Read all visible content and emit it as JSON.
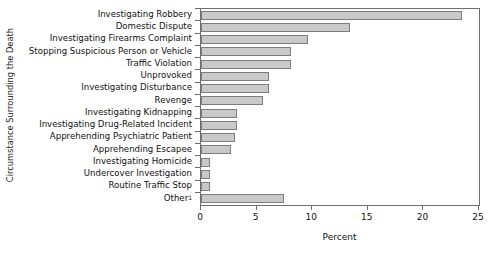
{
  "chart_data": {
    "type": "bar",
    "orientation": "horizontal",
    "title": "",
    "xlabel": "Percent",
    "ylabel": "Circumstance Surrounding the Death",
    "xlim": [
      0,
      25
    ],
    "xticks": [
      0,
      5,
      10,
      15,
      20,
      25
    ],
    "xtick_labels": [
      "0",
      "5",
      "10",
      "15",
      "20",
      "25"
    ],
    "grid": false,
    "legend": false,
    "bar_color": "#c9c9c9",
    "bar_edge_color": "#7d7d7d",
    "axis_color": "#6e6e6e",
    "categories": [
      "Investigating Robbery",
      "Domestic Dispute",
      "Investigating Firearms Complaint",
      "Stopping Suspicious Person or Vehicle",
      "Traffic Violation",
      "Unprovoked",
      "Investigating Disturbance",
      "Revenge",
      "Investigating Kidnapping",
      "Investigating Drug-Related Incident",
      "Apprehending Psychiatric Patient",
      "Apprehending Escapee",
      "Investigating Homicide",
      "Undercover Investigation",
      "Routine Traffic Stop",
      "Other"
    ],
    "category_footnotes": [
      "",
      "",
      "",
      "",
      "",
      "",
      "",
      "",
      "",
      "",
      "",
      "",
      "",
      "",
      "",
      "1"
    ],
    "values": [
      23.5,
      13.4,
      9.6,
      8.1,
      8.1,
      6.1,
      6.1,
      5.6,
      3.2,
      3.2,
      3.1,
      2.7,
      0.8,
      0.8,
      0.8,
      7.5
    ]
  }
}
